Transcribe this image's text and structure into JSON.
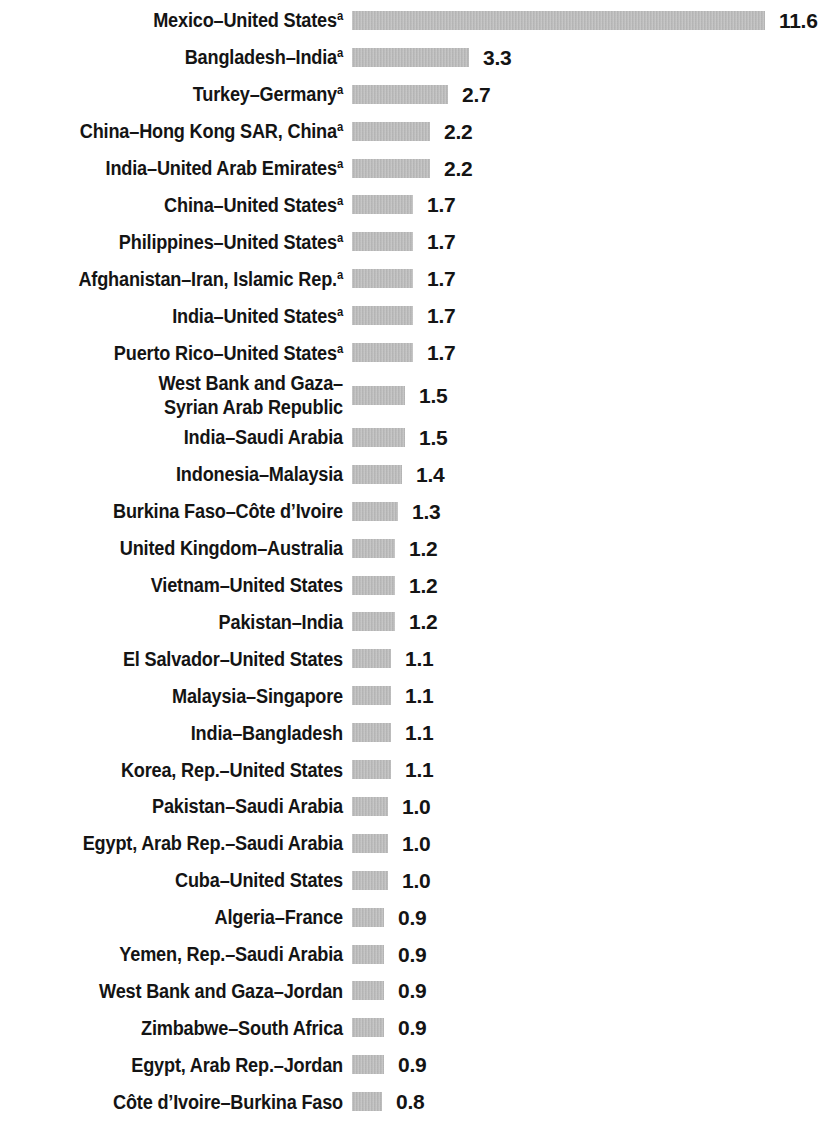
{
  "chart_data": {
    "type": "bar",
    "orientation": "horizontal",
    "title": "",
    "subtitle": "",
    "xlabel": "",
    "ylabel": "",
    "grid": false,
    "legend": null,
    "axis_visible": false,
    "value_labels_shown": true,
    "xlim": [
      0,
      11.6
    ],
    "footnote_marker": "a",
    "bar_color": "#b9b9b9",
    "text_color": "#141414",
    "categories": [
      "Mexico–United States",
      "Bangladesh–India",
      "Turkey–Germany",
      "China–Hong Kong SAR, China",
      "India–United Arab Emirates",
      "China–United States",
      "Philippines–United States",
      "Afghanistan–Iran, Islamic Rep.",
      "India–United States",
      "Puerto Rico–United States",
      "West Bank and Gaza–\nSyrian Arab Republic",
      "India–Saudi Arabia",
      "Indonesia–Malaysia",
      "Burkina Faso–Côte d’Ivoire",
      "United Kingdom–Australia",
      "Vietnam–United States",
      "Pakistan–India",
      "El Salvador–United States",
      "Malaysia–Singapore",
      "India–Bangladesh",
      "Korea, Rep.–United States",
      "Pakistan–Saudi Arabia",
      "Egypt, Arab Rep.–Saudi Arabia",
      "Cuba–United States",
      "Algeria–France",
      "Yemen, Rep.–Saudi Arabia",
      "West Bank and Gaza–Jordan",
      "Zimbabwe–South Africa",
      "Egypt, Arab Rep.–Jordan",
      "Côte d’Ivoire–Burkina Faso"
    ],
    "values": [
      11.6,
      3.3,
      2.7,
      2.2,
      2.2,
      1.7,
      1.7,
      1.7,
      1.7,
      1.7,
      1.5,
      1.5,
      1.4,
      1.3,
      1.2,
      1.2,
      1.2,
      1.1,
      1.1,
      1.1,
      1.1,
      1.0,
      1.0,
      1.0,
      0.9,
      0.9,
      0.9,
      0.9,
      0.9,
      0.8
    ],
    "value_labels": [
      "11.6",
      "3.3",
      "2.7",
      "2.2",
      "2.2",
      "1.7",
      "1.7",
      "1.7",
      "1.7",
      "1.7",
      "1.5",
      "1.5",
      "1.4",
      "1.3",
      "1.2",
      "1.2",
      "1.2",
      "1.1",
      "1.1",
      "1.1",
      "1.1",
      "1.0",
      "1.0",
      "1.0",
      "0.9",
      "0.9",
      "0.9",
      "0.9",
      "0.9",
      "0.8"
    ],
    "footnoted": [
      true,
      true,
      true,
      true,
      true,
      true,
      true,
      true,
      true,
      true,
      false,
      false,
      false,
      false,
      false,
      false,
      false,
      false,
      false,
      false,
      false,
      false,
      false,
      false,
      false,
      false,
      false,
      false,
      false,
      false
    ]
  }
}
